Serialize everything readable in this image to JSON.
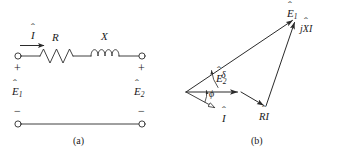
{
  "figure": {
    "width": 348,
    "height": 153,
    "background": "#ffffff",
    "ink": "#2b2b2b",
    "text_color": "#1a1a1a"
  },
  "panel_a": {
    "caption": "(a)",
    "labels": {
      "current": "I",
      "resistor": "R",
      "reactance": "X",
      "source_voltage": "E",
      "source_voltage_sub": "1",
      "load_voltage": "E",
      "load_voltage_sub": "2",
      "plus_left": "+",
      "plus_right": "+",
      "minus_left": "−",
      "minus_right": "−"
    },
    "components": [
      {
        "name": "resistor",
        "symbol": "zigzag",
        "label": "R"
      },
      {
        "name": "inductor",
        "symbol": "coil",
        "label": "X"
      },
      {
        "name": "terminal-top-left",
        "symbol": "open-circle"
      },
      {
        "name": "terminal-top-right",
        "symbol": "open-circle"
      },
      {
        "name": "terminal-bottom-left",
        "symbol": "open-circle"
      },
      {
        "name": "terminal-bottom-right",
        "symbol": "open-circle"
      }
    ]
  },
  "panel_b": {
    "caption": "(b)",
    "labels": {
      "e1": "E",
      "e1_sub": "1",
      "e2": "E",
      "e2_sub": "2",
      "jxi": "jXI",
      "ri": "RI",
      "current": "I",
      "delta": "δ",
      "phi": "ϕ"
    },
    "phasors": [
      {
        "name": "E1",
        "label": "Ê1",
        "from": [
          0,
          0
        ],
        "to": [
          285,
          -192
        ],
        "description": "sending-end voltage phasor"
      },
      {
        "name": "E2",
        "label": "Ê2",
        "from": [
          0,
          0
        ],
        "to": [
          142,
          0
        ],
        "description": "receiving-end voltage phasor, reference axis"
      },
      {
        "name": "RI",
        "label": "RÎ",
        "from": [
          142,
          0
        ],
        "to": [
          190,
          36
        ],
        "description": "resistive voltage drop"
      },
      {
        "name": "jXI",
        "label": "jXÎ",
        "from": [
          190,
          36
        ],
        "to": [
          285,
          -192
        ],
        "description": "reactive voltage drop"
      },
      {
        "name": "I",
        "label": "Î",
        "from": [
          0,
          0
        ],
        "to": [
          84,
          46
        ],
        "description": "current phasor, hollow arrowhead"
      }
    ],
    "angles": [
      {
        "name": "delta",
        "symbol": "δ",
        "between": [
          "E2",
          "E1"
        ],
        "description": "power angle between E2 and E1"
      },
      {
        "name": "phi",
        "symbol": "ϕ",
        "between": [
          "E2",
          "I"
        ],
        "description": "power-factor angle between E2 and I"
      }
    ]
  }
}
